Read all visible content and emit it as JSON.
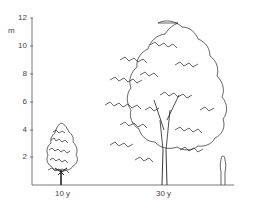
{
  "figure": {
    "unit_label": "m",
    "y_axis": {
      "ticks": [
        {
          "value": "12",
          "y": 18
        },
        {
          "value": "10",
          "y": 46
        },
        {
          "value": "8",
          "y": 74
        },
        {
          "value": "6",
          "y": 102
        },
        {
          "value": "4",
          "y": 130
        },
        {
          "value": "2",
          "y": 157
        }
      ]
    },
    "trees": [
      {
        "age_label": "10 y",
        "height_m": 4.3
      },
      {
        "age_label": "30 y",
        "height_m": 11.5
      }
    ],
    "scale_figure": "person-silhouette",
    "line_color": "#222222"
  }
}
